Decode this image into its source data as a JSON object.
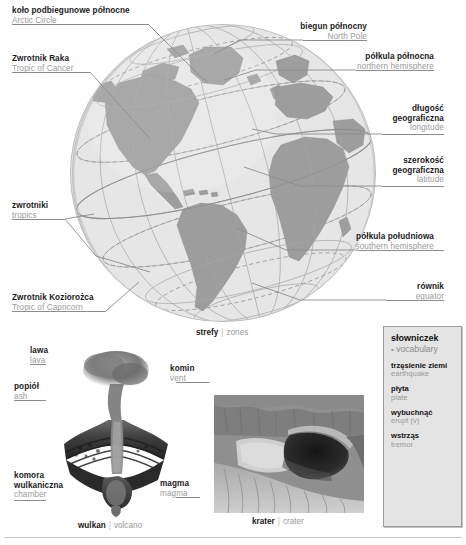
{
  "globe": {
    "caption": {
      "pl": "strefy",
      "sep": "|",
      "en": "zones"
    },
    "labels": [
      {
        "id": "arctic-circle",
        "pl": "koło podbiegunowe północne",
        "en": "Arctic Circle",
        "side": "left"
      },
      {
        "id": "tropic-of-cancer",
        "pl": "Zwrotnik Raka",
        "en": "Tropic of Cancer",
        "side": "left"
      },
      {
        "id": "tropics",
        "pl": "zwrotniki",
        "en": "tropics",
        "side": "left"
      },
      {
        "id": "tropic-of-capricorn",
        "pl": "Zwrotnik Koziorożca",
        "en": "Tropic of Capricorn",
        "side": "left"
      },
      {
        "id": "north-pole",
        "pl": "biegun północny",
        "en": "North Pole",
        "side": "right"
      },
      {
        "id": "northern-hemisphere",
        "pl": "półkula północna",
        "en": "northern hemisphere",
        "side": "right"
      },
      {
        "id": "longitude",
        "pl": "długość\ngeograficzna",
        "en": "longitude",
        "side": "right"
      },
      {
        "id": "latitude",
        "pl": "szerokość\ngeograficzna",
        "en": "latitude",
        "side": "right"
      },
      {
        "id": "southern-hemisphere",
        "pl": "półkula południowa",
        "en": "southern hemisphere",
        "side": "right"
      },
      {
        "id": "equator",
        "pl": "równik",
        "en": "equator",
        "side": "right"
      }
    ]
  },
  "longitude": {
    "pl_line1": "długość",
    "pl_line2": "geograficzna",
    "en": "longitude"
  },
  "latitude": {
    "pl_line1": "szerokość",
    "pl_line2": "geograficzna",
    "en": "latitude"
  },
  "chamber": {
    "pl_line1": "komora",
    "pl_line2": "wulkaniczna",
    "en": "chamber"
  },
  "volcano": {
    "caption": {
      "pl": "wulkan",
      "sep": "|",
      "en": "volcano"
    },
    "labels": [
      {
        "id": "lava",
        "pl": "lawa",
        "en": "lava"
      },
      {
        "id": "ash",
        "pl": "popiół",
        "en": "ash"
      },
      {
        "id": "vent",
        "pl": "komin",
        "en": "vent"
      },
      {
        "id": "magma",
        "pl": "magma",
        "en": "magma"
      }
    ]
  },
  "crater": {
    "caption": {
      "pl": "krater",
      "sep": "|",
      "en": "crater"
    }
  },
  "vocabulary": {
    "title_pl": "słowniczek",
    "bullet": "•",
    "title_en": "vocabulary",
    "entries": [
      {
        "pl": "trzęsienie ziemi",
        "en": "earthquake"
      },
      {
        "pl": "płyta",
        "en": "plate"
      },
      {
        "pl": "wybuchnąć",
        "en": "erupt (v)"
      },
      {
        "pl": "wstrząs",
        "en": "tremor"
      }
    ]
  },
  "colors": {
    "land": "#9d9d9d",
    "ocean": "#e4e4e4",
    "text_primary": "#1a1a1a",
    "text_secondary": "#9a9a9a",
    "leader": "#8c8c8c",
    "vocab_bg": "#e4e4e4"
  }
}
